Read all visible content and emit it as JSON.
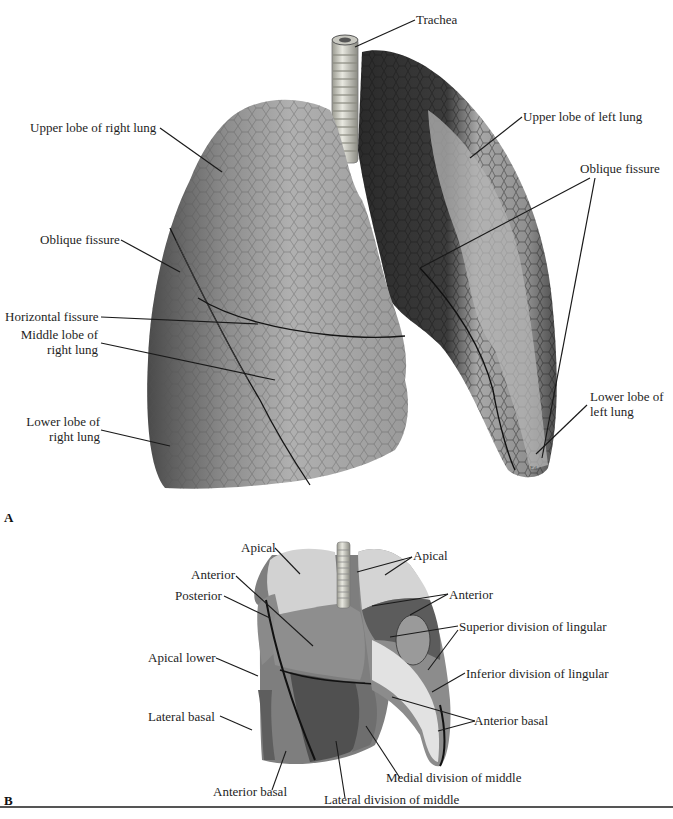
{
  "figure": {
    "panel_a": {
      "letter": "A",
      "labels": {
        "trachea": "Trachea",
        "upper_lobe_right": "Upper lobe of right lung",
        "upper_lobe_left": "Upper lobe of left lung",
        "oblique_fissure_right": "Oblique fissure",
        "oblique_fissure_left": "Oblique fissure",
        "horizontal_fissure": "Horizontal fissure",
        "middle_lobe_right_1": "Middle lobe of",
        "middle_lobe_right_2": "right lung",
        "lower_lobe_right_1": "Lower lobe of",
        "lower_lobe_right_2": "right lung",
        "lower_lobe_left_1": "Lower lobe of",
        "lower_lobe_left_2": "left lung"
      },
      "signature": "Ed."
    },
    "panel_b": {
      "letter": "B",
      "labels": {
        "apical_right": "Apical",
        "apical_left": "Apical",
        "anterior_right": "Anterior",
        "anterior_left": "Anterior",
        "posterior": "Posterior",
        "apical_lower": "Apical lower",
        "lateral_basal": "Lateral basal",
        "anterior_basal_right": "Anterior basal",
        "anterior_basal_left": "Anterior basal",
        "superior_lingular": "Superior division of lingular",
        "inferior_lingular": "Inferior division of lingular",
        "medial_middle": "Medial division of middle",
        "lateral_middle": "Lateral division of middle"
      }
    },
    "colors": {
      "background": "#ffffff",
      "lung_light": "#b8b8b8",
      "lung_mid": "#8a8a8a",
      "lung_dark": "#3a3a3a",
      "trachea": "#d8d8cc",
      "segment_pale": "#d0d0d0",
      "segment_mid": "#8c8c8c",
      "segment_dark": "#5a5a5a",
      "leader_line": "#1a1a1a"
    }
  }
}
